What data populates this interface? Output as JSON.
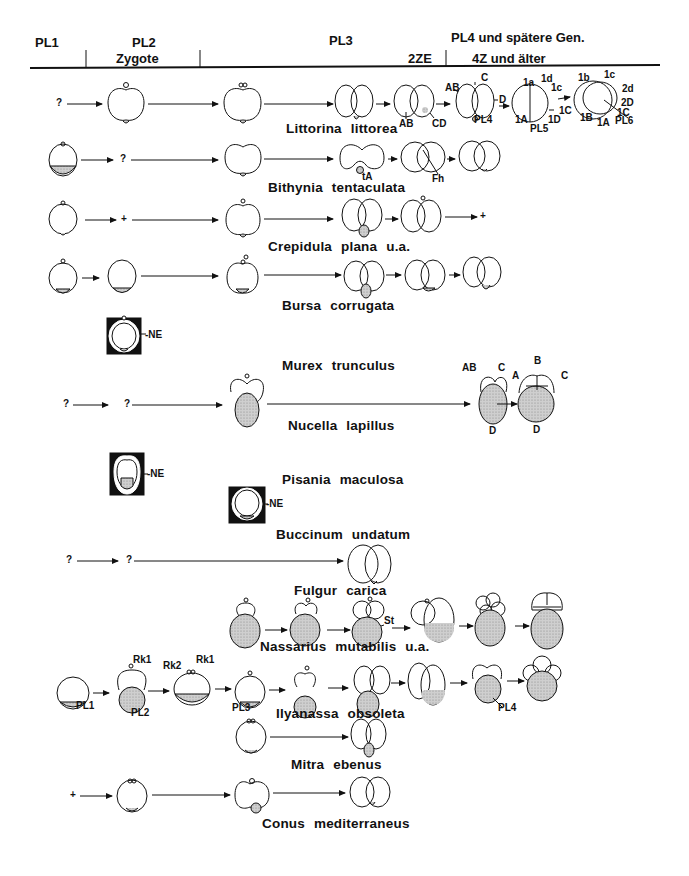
{
  "header": {
    "columns": [
      {
        "top": "PL1",
        "bottom": ""
      },
      {
        "top": "PL2",
        "bottom": "Zygote"
      },
      {
        "top": "PL3",
        "bottom": "2ZE"
      },
      {
        "top": "PL4 und spätere Gen.",
        "bottom": "4Z und älter"
      }
    ]
  },
  "species": [
    {
      "name": "Littorina  littorea"
    },
    {
      "name": "Bithynia  tentaculata"
    },
    {
      "name": "Crepidula  plana  u.a."
    },
    {
      "name": "Bursa  corrugata"
    },
    {
      "name": "Murex  trunculus"
    },
    {
      "name": "Nucella  lapillus"
    },
    {
      "name": "Pisania  maculosa"
    },
    {
      "name": "Buccinum  undatum"
    },
    {
      "name": "Fulgur  carica"
    },
    {
      "name": "Nassarius  mutabilis  u.a."
    },
    {
      "name": "Ilyanassa  obsoleta"
    },
    {
      "name": "Mitra  ebenus"
    },
    {
      "name": "Conus  mediterraneus"
    }
  ],
  "markers": {
    "unknown": "?",
    "absent": "+",
    "ne": "-NE"
  },
  "labels": {
    "littorina": [
      "AB",
      "CD",
      "AB",
      "C",
      "D",
      "PL4",
      "1a",
      "1d",
      "1c",
      "1C",
      "1A",
      "PL5",
      "1D",
      "1b",
      "1c",
      "2d",
      "2D",
      "1C",
      "1B",
      "1A",
      "PL6"
    ],
    "bithynia": [
      "tA",
      "Fh"
    ],
    "nucella": [
      "AB",
      "C",
      "D",
      "B",
      "A",
      "C",
      "D"
    ],
    "nassarius": [
      "St"
    ],
    "ilyanassa": [
      "PL1",
      "Rk1",
      "PL2",
      "Rk2",
      "Rk1",
      "PL3",
      "PL4"
    ]
  }
}
